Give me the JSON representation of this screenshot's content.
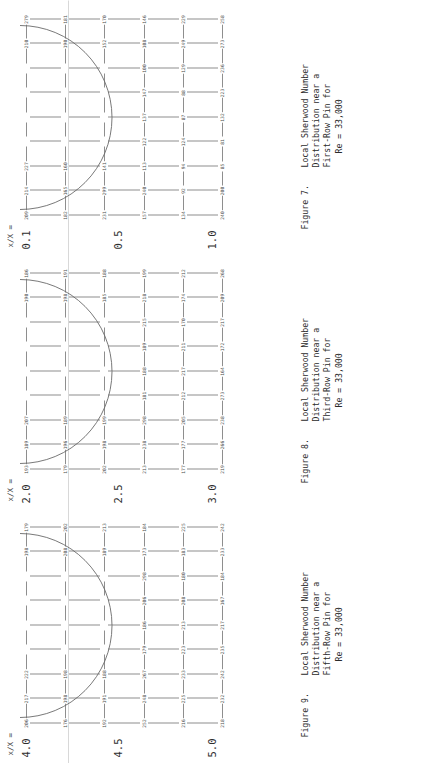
{
  "page": {
    "rotation_deg": -90,
    "background": "#ffffff",
    "grid_line_color": "#8e8e8e",
    "number_color": "#4a4a4a"
  },
  "axis": {
    "title": "x/X ="
  },
  "figures": [
    {
      "id": "figure-7",
      "caption_label": "Figure 7.",
      "caption_lines": [
        "Local Sherwood Number",
        "Distribution near a",
        "First-Row Pin for",
        "Re = 33,000"
      ],
      "axis_title": "x/X =",
      "axis_ticks": [
        "0.1",
        "0.5",
        "1.0"
      ],
      "chart_data": {
        "type": "heatmap",
        "title": "Local Sherwood Number Distribution near a First-Row Pin for Re = 33,000",
        "xlabel": "",
        "ylabel": "x/X",
        "grid": true,
        "legend": "none",
        "row_labels": [
          "0.1",
          "",
          "",
          "0.5",
          "",
          "1.0"
        ],
        "col_labels": [
          "1",
          "2",
          "3",
          "4",
          "5",
          "6",
          "7",
          "8",
          "9"
        ],
        "values": [
          [
            209,
            214,
            227,
            210,
            279,
            182,
            null,
            null,
            null
          ],
          [
            165,
            160,
            190,
            181,
            231,
            299,
            null,
            null,
            null
          ],
          [
            141,
            152,
            170,
            157,
            240,
            null,
            null,
            null,
            null
          ],
          [
            113,
            122,
            137,
            147,
            null,
            null,
            null,
            null,
            null
          ],
          [
            100,
            108,
            146,
            134,
            null,
            null,
            null,
            null,
            null
          ],
          [
            92,
            94,
            124,
            null,
            null,
            null,
            null,
            null,
            null
          ],
          [
            87,
            88,
            129,
            249,
            229,
            240,
            200,
            null,
            null
          ],
          [
            85,
            81,
            132,
            223,
            236,
            273,
            258,
            null,
            null
          ],
          [
            96,
            107,
            156,
            179,
            229,
            220,
            199,
            null,
            null
          ],
          [
            128,
            138,
            176,
            null,
            null,
            null,
            null,
            null,
            null
          ]
        ],
        "values_flat": [
          209,
          214,
          227,
          210,
          279,
          182,
          165,
          160,
          190,
          181,
          231,
          299,
          141,
          152,
          170,
          157,
          240,
          113,
          122,
          137,
          147,
          100,
          108,
          146,
          134,
          92,
          94,
          124,
          87,
          88,
          129,
          249,
          229,
          240,
          200,
          85,
          81,
          132,
          223,
          236,
          273,
          258,
          96,
          107,
          156,
          179,
          229,
          220,
          199,
          128,
          138,
          176
        ]
      }
    },
    {
      "id": "figure-8",
      "caption_label": "Figure 8.",
      "caption_lines": [
        "Local Sherwood Number",
        "Distribution near a",
        "Third-Row Pin for",
        "Re = 33,000"
      ],
      "axis_title": "x/X =",
      "axis_ticks": [
        "2.0",
        "2.5",
        "3.0"
      ],
      "chart_data": {
        "type": "heatmap",
        "title": "Local Sherwood Number Distribution near a Third-Row Pin for Re = 33,000",
        "xlabel": "",
        "ylabel": "x/X",
        "grid": true,
        "legend": "none",
        "row_labels": [
          "2.0",
          "",
          "",
          "2.5",
          "",
          "3.0"
        ],
        "col_labels": [
          "1",
          "2",
          "3",
          "4",
          "5",
          "6",
          "7",
          "8",
          "9"
        ],
        "values_flat": [
          193,
          189,
          207,
          190,
          186,
          179,
          196,
          189,
          198,
          191,
          202,
          198,
          199,
          185,
          188,
          213,
          238,
          298,
          181,
          188,
          189,
          215,
          218,
          199,
          177,
          177,
          205,
          212,
          217,
          211,
          170,
          174,
          212,
          219,
          266,
          238,
          273,
          164,
          172,
          217,
          209,
          268,
          230,
          220,
          159,
          160,
          204,
          204,
          238,
          275,
          228,
          157,
          170,
          187,
          218,
          222,
          226,
          160,
          174,
          197,
          218,
          222,
          221,
          169,
          179,
          197
        ]
      }
    },
    {
      "id": "figure-9",
      "caption_label": "Figure 9.",
      "caption_lines": [
        "Local Sherwood Number",
        "Distribution near a",
        "Fifth-Row Pin for",
        "Re = 33,000"
      ],
      "axis_title": "x/X =",
      "axis_ticks": [
        "4.0",
        "4.5",
        "5.0"
      ],
      "chart_data": {
        "type": "heatmap",
        "title": "Local Sherwood Number Distribution near a Fifth-Row Pin for Re = 33,000",
        "xlabel": "",
        "ylabel": "x/X",
        "grid": true,
        "legend": "none",
        "row_labels": [
          "4.0",
          "",
          "",
          "4.5",
          "",
          "5.0"
        ],
        "col_labels": [
          "1",
          "2",
          "3",
          "4",
          "5",
          "6",
          "7",
          "8",
          "9"
        ],
        "values_flat": [
          206,
          217,
          222,
          198,
          179,
          176,
          198,
          198,
          208,
          202,
          192,
          191,
          188,
          189,
          213,
          252,
          248,
          267,
          179,
          186,
          206,
          298,
          173,
          184,
          216,
          225,
          233,
          223,
          213,
          208,
          180,
          183,
          225,
          218,
          232,
          242,
          235,
          217,
          167,
          184,
          233,
          242,
          227,
          170,
          187,
          223,
          298,
          292,
          229,
          227,
          171,
          190,
          232,
          242,
          221,
          229,
          224,
          180,
          196,
          228,
          242,
          221,
          229,
          190,
          201,
          226,
          221,
          224,
          229
        ]
      }
    }
  ]
}
